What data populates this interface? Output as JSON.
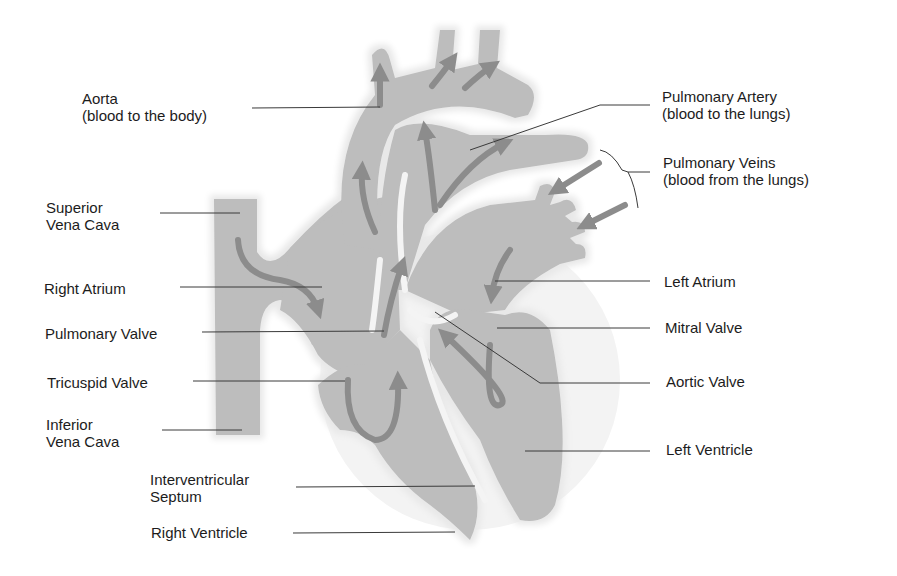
{
  "diagram": {
    "colors": {
      "background": "#ffffff",
      "tissue": "#bdbdbd",
      "tissue_shadow": "#a9a9a9",
      "arrow": "#8c8c8c",
      "outline_glow": "#e4e4e4",
      "leader_line": "#3a3a3a",
      "text": "#1c1c1c"
    },
    "labels": {
      "aorta": {
        "line1": "Aorta",
        "line2": "(blood to the body)"
      },
      "pulmonary_artery": {
        "line1": "Pulmonary Artery",
        "line2": "(blood to the lungs)"
      },
      "pulmonary_veins": {
        "line1": "Pulmonary Veins",
        "line2": "(blood from the lungs)"
      },
      "superior_vena_cava": {
        "line1": "Superior",
        "line2": "Vena Cava"
      },
      "right_atrium": {
        "line1": "Right Atrium"
      },
      "left_atrium": {
        "line1": "Left Atrium"
      },
      "pulmonary_valve": {
        "line1": "Pulmonary Valve"
      },
      "mitral_valve": {
        "line1": "Mitral Valve"
      },
      "tricuspid_valve": {
        "line1": "Tricuspid Valve"
      },
      "aortic_valve": {
        "line1": "Aortic Valve"
      },
      "inferior_vena_cava": {
        "line1": "Inferior",
        "line2": "Vena Cava"
      },
      "left_ventricle": {
        "line1": "Left Ventricle"
      },
      "interventricular_septum": {
        "line1": "Interventricular",
        "line2": "Septum"
      },
      "right_ventricle": {
        "line1": "Right Ventricle"
      }
    }
  }
}
